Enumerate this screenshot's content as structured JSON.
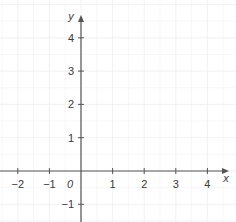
{
  "chart_data": {
    "type": "scatter",
    "title": "",
    "xlabel": "x",
    "ylabel": "y",
    "xlim": [
      -2.5,
      4.6
    ],
    "ylim": [
      -1.6,
      4.6
    ],
    "grid": true,
    "origin_label": "0",
    "x_ticks": [
      -2,
      -1,
      1,
      2,
      3,
      4
    ],
    "x_tick_labels": [
      "−2",
      "−1",
      "1",
      "2",
      "3",
      "4"
    ],
    "y_ticks": [
      -1,
      1,
      2,
      3,
      4
    ],
    "y_tick_labels": [
      "−1",
      "1",
      "2",
      "3",
      "4"
    ],
    "series": []
  },
  "colors": {
    "axis": "#555555",
    "grid": "#eeeeee",
    "text": "#3a3a3a"
  }
}
